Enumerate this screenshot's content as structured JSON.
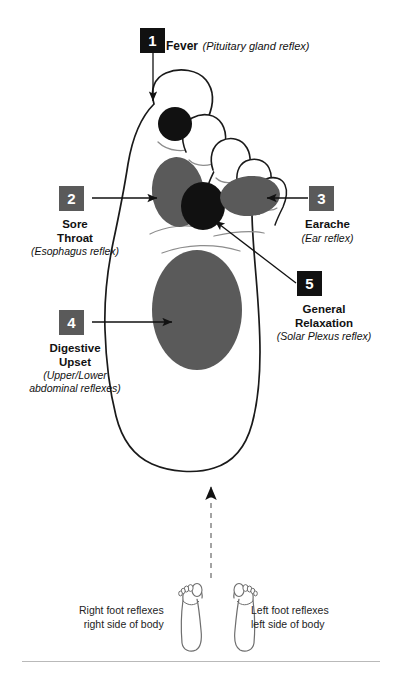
{
  "diagram": {
    "kind": "foot-reflexology-chart",
    "view": "sole-of-right-foot",
    "colors": {
      "zone_gray": "#5a5a5a",
      "zone_black": "#111111",
      "outline": "#1a1a1a",
      "dashed_guide": "#9a9a9a",
      "rule": "#b9b9b9",
      "background": "#ffffff"
    }
  },
  "labels": [
    {
      "number": "1",
      "box_color": "black",
      "title": "Fever",
      "subtitle": "(Pituitary gland reflex)",
      "layout": "inline",
      "target_zone": "pituitary"
    },
    {
      "number": "2",
      "box_color": "gray",
      "title_line1": "Sore",
      "title_line2": "Throat",
      "subtitle": "(Esophagus reflex)",
      "layout": "stacked",
      "target_zone": "esophagus"
    },
    {
      "number": "3",
      "box_color": "gray",
      "title_line1": "Earache",
      "subtitle": "(Ear reflex)",
      "layout": "stacked",
      "target_zone": "ear"
    },
    {
      "number": "4",
      "box_color": "gray",
      "title_line1": "Digestive",
      "title_line2": "Upset",
      "subtitle_line1": "(Upper/Lower",
      "subtitle_line2": "abdominal reflexes)",
      "layout": "stacked",
      "target_zone": "abdominal"
    },
    {
      "number": "5",
      "box_color": "black",
      "title_line1": "General",
      "title_line2": "Relaxation",
      "subtitle": "(Solar Plexus reflex)",
      "layout": "stacked",
      "target_zone": "solar-plexus"
    }
  ],
  "legend": {
    "right": {
      "line1": "Right foot reflexes",
      "line2": "right side of body"
    },
    "left": {
      "line1": "Left foot reflexes",
      "line2": "left side of body"
    }
  }
}
